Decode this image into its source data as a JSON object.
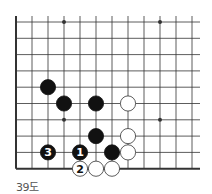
{
  "diagram": {
    "caption": "39도",
    "grid": {
      "x0": 16,
      "y0": 22,
      "dx": 16,
      "dy": 16.3,
      "cols": 12,
      "rows": 10,
      "right_extent": 200,
      "left_edge": true,
      "bottom_edge": true
    },
    "star_points": [
      {
        "col": 3,
        "row": 0
      },
      {
        "col": 9,
        "row": 0
      },
      {
        "col": 3,
        "row": 6
      },
      {
        "col": 9,
        "row": 6
      }
    ],
    "stones": [
      {
        "color": "black",
        "col": 2,
        "row": 4,
        "label": ""
      },
      {
        "color": "black",
        "col": 3,
        "row": 5,
        "label": ""
      },
      {
        "color": "black",
        "col": 5,
        "row": 5,
        "label": ""
      },
      {
        "color": "white",
        "col": 7,
        "row": 5,
        "label": ""
      },
      {
        "color": "black",
        "col": 5,
        "row": 7,
        "label": ""
      },
      {
        "color": "white",
        "col": 7,
        "row": 7,
        "label": ""
      },
      {
        "color": "black",
        "col": 2,
        "row": 8,
        "label": "3"
      },
      {
        "color": "black",
        "col": 4,
        "row": 8,
        "label": "1"
      },
      {
        "color": "black",
        "col": 6,
        "row": 8,
        "label": ""
      },
      {
        "color": "white",
        "col": 7,
        "row": 8,
        "label": ""
      },
      {
        "color": "white",
        "col": 4,
        "row": 9,
        "label": "2"
      },
      {
        "color": "white",
        "col": 5,
        "row": 9,
        "label": ""
      },
      {
        "color": "white",
        "col": 6,
        "row": 9,
        "label": ""
      }
    ],
    "colors": {
      "line": "#333333",
      "black_stone": "#111111",
      "white_stone": "#ffffff",
      "white_stroke": "#333333"
    }
  }
}
